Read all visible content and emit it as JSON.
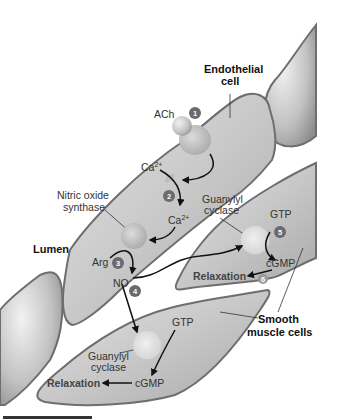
{
  "labels": {
    "endothelial_cell_line1": "Endothelial",
    "endothelial_cell_line2": "cell",
    "ach": "ACh",
    "ca_top": "Ca",
    "ca_top_sup": "2+",
    "ca_mid": "Ca",
    "ca_mid_sup": "2+",
    "nos_line1": "Nitric oxide",
    "nos_line2": "synthase",
    "lumen": "Lumen",
    "arg": "Arg",
    "no": "NO",
    "gc_upper_line1": "Guanylyl",
    "gc_upper_line2": "cyclase",
    "gtp_upper": "GTP",
    "cgmp_upper": "cGMP",
    "relaxation_upper": "Relaxation",
    "smooth_line1": "Smooth",
    "smooth_line2": "muscle cells",
    "gtp_lower": "GTP",
    "gc_lower_line1": "Guanylyl",
    "gc_lower_line2": "cyclase",
    "cgmp_lower": "cGMP",
    "relaxation_lower": "Relaxation"
  },
  "steps": [
    "1",
    "2",
    "3",
    "4",
    "5",
    "6"
  ],
  "colors": {
    "cell_fill": "#c4c4c4",
    "cell_outline": "#6e6e6e",
    "badge": "#6b6b6b",
    "arrow": "#111111",
    "text": "#333333"
  }
}
